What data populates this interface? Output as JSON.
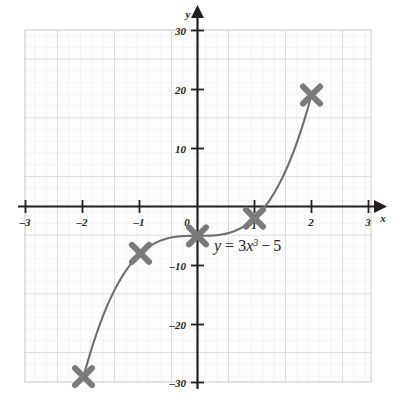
{
  "chart_data": {
    "type": "line",
    "title": "",
    "equation_label": "y = 3x³ − 5",
    "equation_parts": {
      "y": "y",
      "equals": "=",
      "coefficient": "3",
      "variable": "x",
      "exponent": "3",
      "minus": "−",
      "constant": "5"
    },
    "xlabel": "x",
    "ylabel": "y",
    "xlim": [
      -3,
      3
    ],
    "ylim": [
      -30,
      30
    ],
    "xticks": [
      -3,
      -2,
      -1,
      0,
      1,
      2,
      3
    ],
    "xtick_labels": [
      "–3",
      "–2",
      "–1",
      "0",
      "1",
      "2",
      "3"
    ],
    "yticks": [
      -30,
      -20,
      -10,
      0,
      10,
      20,
      30
    ],
    "ytick_labels": [
      "–30",
      "–20",
      "–10",
      "0",
      "10",
      "20",
      "30"
    ],
    "grid": true,
    "grid_minor_step_x": 0.2,
    "grid_minor_step_y": 2,
    "grid_major_step_x": 1,
    "grid_major_step_y": 10,
    "marker_style": "x-cross",
    "series": [
      {
        "name": "y = 3x³ − 5",
        "x": [
          -2,
          -1,
          0,
          1,
          2
        ],
        "values": [
          -29,
          -8,
          -5,
          -2,
          19
        ],
        "curve_color": "#6f6e6e",
        "marker_color": "#7b7a7a"
      }
    ],
    "colors": {
      "axis": "#231f20",
      "curve": "#6f6e6e",
      "marker": "#7b7a7a",
      "grid_major": "#c8c8cc",
      "grid_minor": "#e2e2e6",
      "text": "#231f20",
      "background": "#ffffff"
    }
  },
  "annotations": {
    "equation_x": 0.36,
    "equation_y": -7.5
  }
}
